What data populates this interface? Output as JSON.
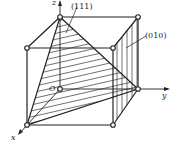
{
  "diagram": {
    "axes": {
      "x": "x",
      "y": "y",
      "z": "z",
      "origin": "O"
    },
    "planes": [
      {
        "label": "(111)",
        "description": "triangular plane through x, y, z intercepts, hatched"
      },
      {
        "label": "(010)",
        "description": "right face plane perpendicular to y, vertical hatching"
      }
    ],
    "colors": {
      "line": "#222222",
      "background": "#ffffff"
    }
  }
}
